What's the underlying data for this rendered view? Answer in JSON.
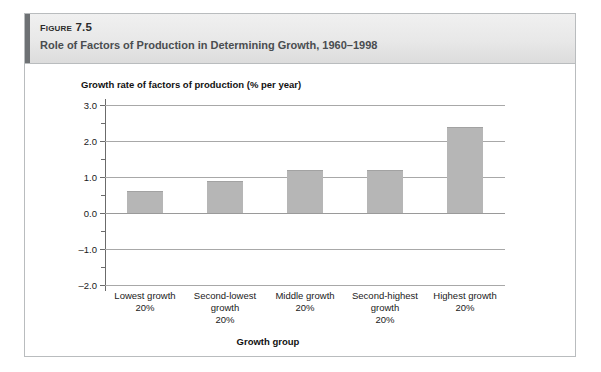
{
  "figure": {
    "number": "Figure 7.5",
    "title": "Role of Factors of Production in Determining Growth, 1960–1998",
    "accent_color": "#6e7174",
    "header_bg": "#e8e8e8",
    "border_color": "#b9bcbe"
  },
  "chart_data": {
    "type": "bar",
    "title": "Role of Factors of Production in Determining Growth, 1960–1998",
    "categories": [
      "Lowest growth\n20%",
      "Second-lowest\ngrowth\n20%",
      "Middle growth\n20%",
      "Second-highest\ngrowth\n20%",
      "Highest growth\n20%"
    ],
    "values": [
      0.6,
      0.9,
      1.2,
      1.2,
      2.4
    ],
    "xlabel": "Growth group",
    "ylabel": "Growth rate of factors of production (% per year)",
    "ylim": [
      -2.0,
      3.0
    ],
    "ytick_labels": [
      "3.0",
      "2.0",
      "1.0",
      "0.0",
      "–1.0",
      "–2.0"
    ],
    "ytick_values": [
      3.0,
      2.0,
      1.0,
      0.0,
      -1.0,
      -2.0
    ],
    "minor_tick_values": [
      2.5,
      1.5,
      0.5,
      -0.5,
      -1.5
    ],
    "grid": true,
    "legend": null,
    "bar_color": "#b6b6b6",
    "gridline_color": "#a8a8a8"
  },
  "category_labels": [
    {
      "line1": "Lowest growth",
      "line2": "20%",
      "line3": ""
    },
    {
      "line1": "Second-lowest",
      "line2": "growth",
      "line3": "20%"
    },
    {
      "line1": "Middle growth",
      "line2": "20%",
      "line3": ""
    },
    {
      "line1": "Second-highest",
      "line2": "growth",
      "line3": "20%"
    },
    {
      "line1": "Highest growth",
      "line2": "20%",
      "line3": ""
    }
  ]
}
